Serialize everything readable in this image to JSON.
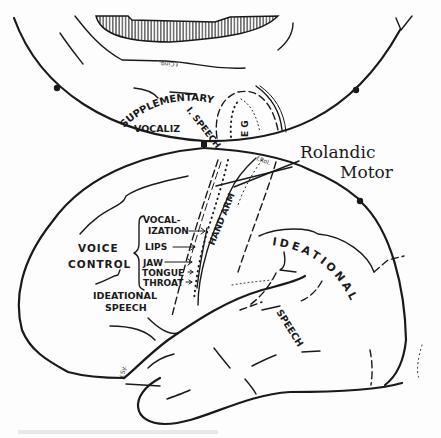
{
  "diagram": {
    "colors": {
      "ink": "#1a1a1a",
      "paper": "#fdfdfd"
    },
    "medial_view": {
      "sulcus_label": "f.Cing.",
      "labels": {
        "supplementary": "SUPPLEMENTARY M.",
        "i_speech": "I. SPEECH",
        "vocaliz": "VOCALIZ",
        "eg": "E G"
      }
    },
    "lateral_view": {
      "rolandic_label_line1": "Rolandic",
      "rolandic_label_line2": "Motor",
      "fissure_rolandic": "f.Rol.",
      "fissure_sylvian": "f.Sy.",
      "hand_arm": "HAND ARM",
      "voice_control_line1": "VOICE",
      "voice_control_line2": "CONTROL",
      "motor_list": [
        {
          "label": "VOCAL-"
        },
        {
          "label": "IZATION"
        },
        {
          "label": "LIPS"
        },
        {
          "label": "JAW"
        },
        {
          "label": "TONGUE"
        },
        {
          "label": "THROAT"
        }
      ],
      "ideational_speech_anterior_line1": "IDEATIONAL",
      "ideational_speech_anterior_line2": "SPEECH",
      "ideational_posterior": "IDEATIONAL",
      "speech_posterior": "SPEECH"
    }
  }
}
